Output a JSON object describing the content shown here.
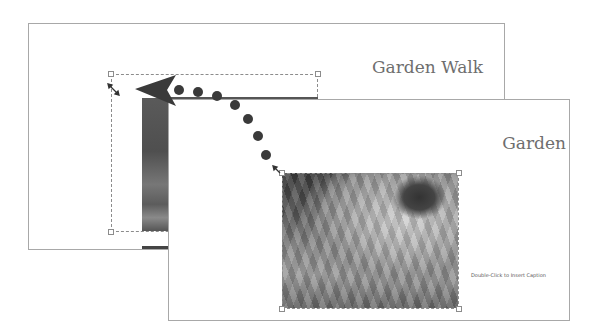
{
  "back_slide": {
    "title": "Garden Walk"
  },
  "front_slide": {
    "title": "Garden",
    "caption_placeholder": "Double-Click to Insert Caption"
  },
  "annotation": {
    "type": "move-arrow",
    "direction": "from front slide image to back slide image position",
    "color": "#333333"
  },
  "colors": {
    "slide_border": "#a8a8a8",
    "title_text": "#6e6e6e",
    "selection_dash": "#8c8c8c",
    "arrow": "#333333"
  }
}
